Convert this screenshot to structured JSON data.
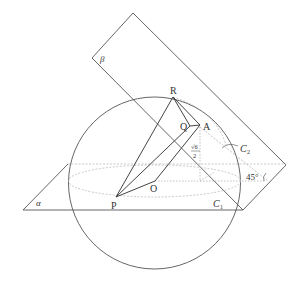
{
  "diagram": {
    "labels": {
      "R": "R",
      "Q": "Q",
      "A": "A",
      "O": "O",
      "P": "P",
      "alpha": "α",
      "beta": "β",
      "C1": "C",
      "C1_sub": "1",
      "C2": "C",
      "C2_sub": "2",
      "angle": "45°",
      "height_num": "√6",
      "height_den": "2"
    },
    "colors": {
      "line": "#444444",
      "dotted": "#aaaaaa",
      "plane": "#555555"
    }
  }
}
